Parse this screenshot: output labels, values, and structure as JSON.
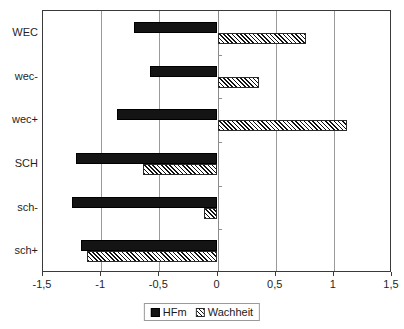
{
  "chart_data": {
    "type": "bar",
    "orientation": "horizontal",
    "title": "",
    "subtitle": "",
    "xlabel": "",
    "ylabel": "",
    "categories": [
      "WEC",
      "wec-",
      "wec+",
      "SCH",
      "sch-",
      "sch+"
    ],
    "series": [
      {
        "name": "HFm",
        "fill": "solid-black",
        "color": "#141414",
        "values": [
          -0.72,
          -0.58,
          -0.86,
          -1.22,
          -1.25,
          -1.17
        ]
      },
      {
        "name": "Wachheit",
        "fill": "diagonal-hatch",
        "color": "#ffffff",
        "values": [
          0.76,
          0.36,
          1.11,
          -0.64,
          -0.12,
          -1.12
        ]
      }
    ],
    "xlim": [
      -1.5,
      1.5
    ],
    "xticks": [
      -1.5,
      -1.0,
      -0.5,
      0,
      0.5,
      1.0,
      1.5
    ],
    "xtick_labels": [
      "-1,5",
      "-1",
      "-0,5",
      "0",
      "0,5",
      "1",
      "1,5"
    ],
    "grid": true,
    "grid_axis": "x",
    "legend_position": "bottom",
    "legend_entries": [
      "HFm",
      "Wachheit"
    ],
    "axis_color": "#3a3a3a",
    "grid_color": "#9a9a9a"
  }
}
